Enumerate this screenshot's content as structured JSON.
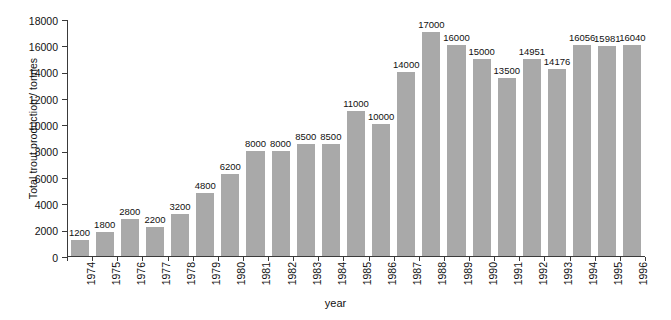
{
  "chart_data": {
    "type": "bar",
    "title": "",
    "xlabel": "year",
    "ylabel": "Total trout production / tonnes",
    "ylim": [
      0,
      18000
    ],
    "yticks": [
      0,
      2000,
      4000,
      6000,
      8000,
      10000,
      12000,
      14000,
      16000,
      18000
    ],
    "grid": false,
    "legend": null,
    "categories": [
      "1974",
      "1975",
      "1976",
      "1977",
      "1978",
      "1979",
      "1980",
      "1981",
      "1982",
      "1983",
      "1984",
      "1985",
      "1986",
      "1987",
      "1988",
      "1989",
      "1990",
      "1991",
      "1992",
      "1993",
      "1994",
      "1995",
      "1996"
    ],
    "values": [
      1200,
      1800,
      2800,
      2200,
      3200,
      4800,
      6200,
      8000,
      8000,
      8500,
      8500,
      11000,
      10000,
      14000,
      17000,
      16000,
      15000,
      13500,
      14951,
      14176,
      16056,
      15981,
      16040
    ],
    "value_labels": [
      "1200",
      "1800",
      "2800",
      "2200",
      "3200",
      "4800",
      "6200",
      "8000",
      "8000",
      "8500",
      "8500",
      "11000",
      "10000",
      "14000",
      "17000",
      "16000",
      "15000",
      "13500",
      "14951",
      "14176",
      "16056",
      "15981",
      "16040"
    ],
    "tick_labels": [
      "0",
      "2000",
      "4000",
      "6000",
      "8000",
      "10000",
      "12000",
      "14000",
      "16000",
      "18000"
    ],
    "bar_color": "#a9a9a9",
    "axis_color": "#3a3a3a",
    "text_color": "#111111"
  }
}
